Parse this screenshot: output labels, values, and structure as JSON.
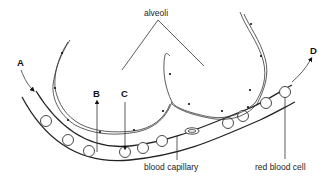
{
  "diagram": {
    "labels": {
      "alveoli": "alveoli",
      "blood_capillary": "blood capillary",
      "red_blood_cell": "red blood cell"
    },
    "arrows": {
      "A": "A",
      "B": "B",
      "C": "C",
      "D": "D"
    },
    "colors": {
      "line": "#222222",
      "background": "#ffffff"
    }
  }
}
